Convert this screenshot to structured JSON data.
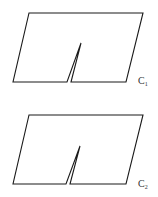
{
  "figures": [
    {
      "id": "C1",
      "label": "C",
      "subscript": "1",
      "description": "Parallelogram with a thin slit cut from the bottom edge"
    },
    {
      "id": "C2",
      "label": "C",
      "subscript": "2",
      "description": "Parallelogram with a thin slit cut from the bottom edge"
    }
  ],
  "colors": {
    "stroke": "#1a1a1a",
    "label": "#333333",
    "background": "#ffffff"
  }
}
